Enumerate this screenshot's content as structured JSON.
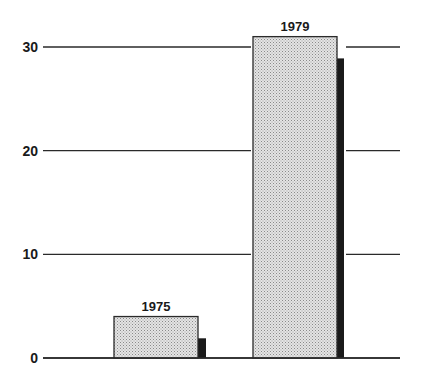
{
  "chart_data": {
    "type": "bar",
    "title": "",
    "xlabel": "",
    "ylabel": "",
    "categories": [
      "1975",
      "1979"
    ],
    "series": [
      {
        "name": "primary (stippled)",
        "values": [
          4.0,
          31.0
        ],
        "color": "#d9d9d9"
      },
      {
        "name": "secondary (dark)",
        "values": [
          1.9,
          28.9
        ],
        "color": "#1a1a1a"
      }
    ],
    "bar_labels": [
      "1975",
      "1979"
    ],
    "ylim": [
      0,
      30
    ],
    "yticks": [
      0,
      10,
      20,
      30
    ],
    "ytick_labels": [
      "0",
      "10",
      "20",
      "30"
    ],
    "grid": true,
    "legend": null
  },
  "colors": {
    "grid": "#2a2a2a",
    "primary_fill": "#d9d9d9",
    "primary_stipple": "#8a8a8a",
    "secondary_fill": "#1a1a1a",
    "text": "#1a1a1a"
  }
}
